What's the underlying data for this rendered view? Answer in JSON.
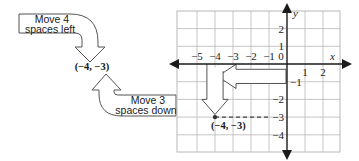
{
  "callouts": {
    "left": {
      "line1": "Move 4",
      "line2": "spaces left"
    },
    "down": {
      "line1": "Move 3",
      "line2": "spaces down"
    }
  },
  "point_label": "(−4, −3)",
  "graph_point_label": "(−4, −3)",
  "axes": {
    "x_label": "x",
    "y_label": "y",
    "x_ticks": [
      {
        "value": -5,
        "label": "−5"
      },
      {
        "value": -4,
        "label": "−4"
      },
      {
        "value": -3,
        "label": "−3"
      },
      {
        "value": -2,
        "label": "−2"
      },
      {
        "value": -1,
        "label": "−1"
      },
      {
        "value": 0,
        "label": "0"
      },
      {
        "value": 1,
        "label": "1"
      },
      {
        "value": 2,
        "label": "2"
      }
    ],
    "y_ticks": [
      {
        "value": 2,
        "label": "2"
      },
      {
        "value": 1,
        "label": "1"
      },
      {
        "value": -1,
        "label": "−1"
      },
      {
        "value": -2,
        "label": "−2"
      },
      {
        "value": -3,
        "label": "−3"
      },
      {
        "value": -4,
        "label": "−4"
      }
    ],
    "x_range": [
      -6,
      3
    ],
    "y_range": [
      -5,
      3
    ]
  },
  "point": {
    "x": -4,
    "y": -3
  },
  "moves": [
    {
      "direction": "left",
      "units": 4
    },
    {
      "direction": "down",
      "units": 3
    }
  ],
  "colors": {
    "line": "#1a1a1a",
    "grid": "#b8b8b8",
    "arrow_outline": "#555555"
  }
}
